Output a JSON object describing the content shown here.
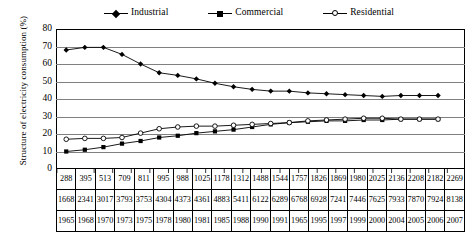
{
  "chart_data": {
    "type": "line",
    "title": "",
    "xlabel": "",
    "ylabel": "Structure of electricity consumption (%)",
    "ylim": [
      0,
      80
    ],
    "ytick_values": [
      0,
      10,
      20,
      30,
      40,
      50,
      60,
      70,
      80
    ],
    "grid": true,
    "legend_position": "top",
    "x": [
      "1965",
      "1968",
      "1970",
      "1973",
      "1975",
      "1978",
      "1980",
      "1981",
      "1985",
      "1988",
      "1990",
      "1991",
      "1965",
      "1995",
      "1997",
      "1999",
      "2000",
      "2004",
      "2005",
      "2006",
      "2007"
    ],
    "categories": [
      "1965",
      "1968",
      "1970",
      "1973",
      "1975",
      "1978",
      "1980",
      "1981",
      "1985",
      "1988",
      "1990",
      "1991",
      "1965",
      "1995",
      "1997",
      "1999",
      "2000",
      "2004",
      "2005",
      "2006",
      "2007"
    ],
    "series": [
      {
        "name": "Industrial",
        "marker": "diamond",
        "values": [
          68,
          69.5,
          69.5,
          65.5,
          60,
          55,
          53.5,
          51.5,
          49,
          47,
          45.5,
          44.5,
          44.5,
          43.5,
          43,
          42.5,
          42,
          41.5,
          42,
          42,
          42
        ]
      },
      {
        "name": "Commercial",
        "marker": "square",
        "values": [
          10,
          11,
          12.5,
          14.5,
          16,
          18,
          19,
          20.5,
          21.5,
          22.5,
          24,
          25.5,
          26.5,
          27,
          27.5,
          27.5,
          28,
          28,
          28.5,
          28.5,
          28.5
        ]
      },
      {
        "name": "Residential",
        "marker": "circle-open",
        "values": [
          17,
          17.5,
          17.5,
          18,
          20.5,
          23,
          24,
          24.5,
          24.5,
          25,
          25.5,
          26,
          26.5,
          27.5,
          28,
          28.5,
          29,
          29,
          28.5,
          28.5,
          28.5
        ]
      }
    ]
  },
  "legend": {
    "items": [
      {
        "label": "Industrial"
      },
      {
        "label": "Commercial"
      },
      {
        "label": "Residential"
      }
    ]
  },
  "axis": {
    "y_title": "Structure of electricity consumption (%)",
    "y_ticks": [
      "80",
      "70",
      "60",
      "50",
      "40",
      "30",
      "20",
      "10",
      "0"
    ]
  },
  "table": {
    "rows": [
      {
        "name": "row-commercial-values",
        "cells": [
          "288",
          "395",
          "513",
          "709",
          "811",
          "995",
          "988",
          "1025",
          "1178",
          "1312",
          "1488",
          "1544",
          "1757",
          "1826",
          "1869",
          "1980",
          "2025",
          "2136",
          "2208",
          "2182",
          "2269"
        ]
      },
      {
        "name": "row-industrial-values",
        "cells": [
          "1668",
          "2341",
          "3017",
          "3793",
          "3753",
          "4304",
          "4373",
          "4361",
          "4883",
          "5411",
          "6122",
          "6289",
          "6768",
          "6928",
          "7241",
          "7446",
          "7625",
          "7933",
          "7870",
          "7924",
          "8138"
        ]
      },
      {
        "name": "row-years",
        "cells": [
          "1965",
          "1968",
          "1970",
          "1973",
          "1975",
          "1978",
          "1980",
          "1981",
          "1985",
          "1988",
          "1990",
          "1991",
          "1965",
          "1995",
          "1997",
          "1999",
          "2000",
          "2004",
          "2005",
          "2006",
          "2007"
        ]
      }
    ]
  }
}
